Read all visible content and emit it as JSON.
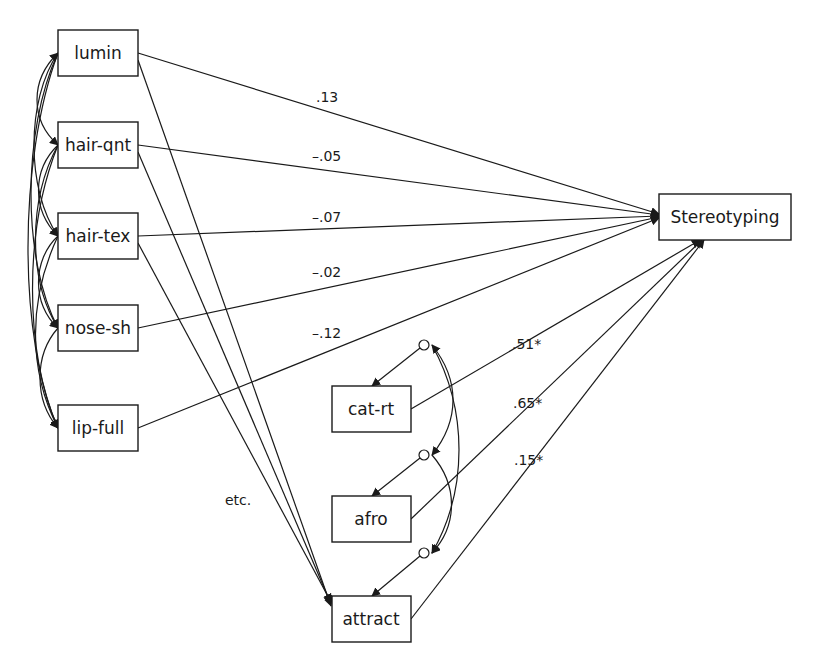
{
  "diagram": {
    "type": "path-model",
    "nodes": {
      "lumin": {
        "label": "lumin"
      },
      "hair_qnt": {
        "label": "hair-qnt"
      },
      "hair_tex": {
        "label": "hair-tex"
      },
      "nose_sh": {
        "label": "nose-sh"
      },
      "lip_full": {
        "label": "lip-full"
      },
      "stereotyping": {
        "label": "Stereotyping"
      },
      "cat_rt": {
        "label": "cat-rt"
      },
      "afro": {
        "label": "afro"
      },
      "attract": {
        "label": "attract"
      }
    },
    "paths_to_stereotyping": [
      {
        "from": "lumin",
        "coef": ".13"
      },
      {
        "from": "hair-qnt",
        "coef": "–.05"
      },
      {
        "from": "hair-tex",
        "coef": "–.07"
      },
      {
        "from": "nose-sh",
        "coef": "–.02"
      },
      {
        "from": "lip-full",
        "coef": "–.12"
      },
      {
        "from": "cat-rt",
        "coef": ".51*"
      },
      {
        "from": "afro",
        "coef": ".65*"
      },
      {
        "from": "attract",
        "coef": ".15*"
      }
    ],
    "paths_to_attract": [
      "lumin",
      "hair-qnt",
      "hair-tex"
    ],
    "annotation": "etc.",
    "error_terms": [
      "cat-rt",
      "afro",
      "attract"
    ],
    "covariances": [
      "exogenous features mutually correlated",
      "error terms of cat-rt, afro, attract correlated"
    ]
  }
}
